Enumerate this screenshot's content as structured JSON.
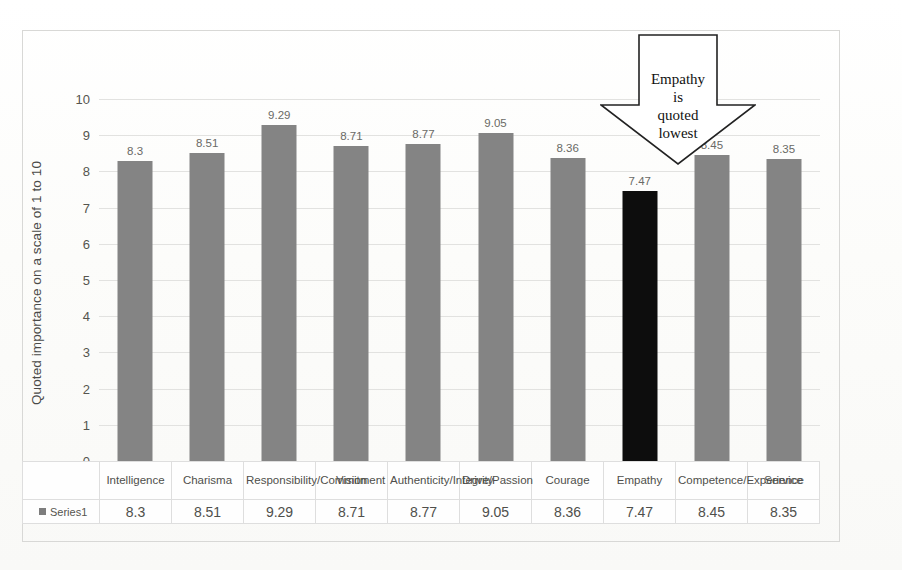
{
  "chart_data": {
    "type": "bar",
    "title": "",
    "xlabel": "",
    "ylabel": "Quoted importance on a scale of 1 to 10",
    "ylim": [
      0,
      10
    ],
    "ytick_step": 1,
    "grid": true,
    "legend_position": "table-stub-left",
    "categories": [
      "Intelligence",
      "Charisma",
      "Responsibility/Commitment",
      "Vision",
      "Authenticity/Integrity",
      "Drive/Passion",
      "Courage",
      "Empathy",
      "Competence/Experience",
      "Service"
    ],
    "series": [
      {
        "name": "Series1",
        "values": [
          8.3,
          8.51,
          9.29,
          8.71,
          8.77,
          9.05,
          8.36,
          7.47,
          8.45,
          8.35
        ]
      }
    ],
    "highlighted_category": "Empathy",
    "annotations": [
      {
        "shape": "down-arrow",
        "text": "Empathy is quoted lowest",
        "points_to": "Empathy"
      }
    ]
  },
  "axis": {
    "y_title": "Quoted importance on a scale of 1 to 10",
    "y_ticks": [
      "10",
      "9",
      "8",
      "7",
      "6",
      "5",
      "4",
      "3",
      "2",
      "1",
      "0"
    ]
  },
  "bars": [
    {
      "category": "Intelligence",
      "value": 8.3,
      "label": "8.3",
      "color": "#848484"
    },
    {
      "category": "Charisma",
      "value": 8.51,
      "label": "8.51",
      "color": "#848484"
    },
    {
      "category": "Responsibility/Commitment",
      "value": 9.29,
      "label": "9.29",
      "color": "#848484"
    },
    {
      "category": "Vision",
      "value": 8.71,
      "label": "8.71",
      "color": "#848484"
    },
    {
      "category": "Authenticity/Integrity",
      "value": 8.77,
      "label": "8.77",
      "color": "#848484"
    },
    {
      "category": "Drive/Passion",
      "value": 9.05,
      "label": "9.05",
      "color": "#848484"
    },
    {
      "category": "Courage",
      "value": 8.36,
      "label": "8.36",
      "color": "#848484"
    },
    {
      "category": "Empathy",
      "value": 7.47,
      "label": "7.47",
      "color": "#0d0d0d"
    },
    {
      "category": "Competence/Experience",
      "value": 8.45,
      "label": "8.45",
      "color": "#848484"
    },
    {
      "category": "Service",
      "value": 8.35,
      "label": "8.35",
      "color": "#848484"
    }
  ],
  "callout": {
    "line1": "Empathy",
    "line2": "is",
    "line3": "quoted",
    "line4": "lowest"
  },
  "table": {
    "legend_label": "Series1",
    "category_labels": [
      "Intelligence",
      "Charisma",
      "Responsibility/Commitment",
      "Vision",
      "Authenticity/Integrity",
      "Drive/Passion",
      "Courage",
      "Empathy",
      "Competence/Experience",
      "Service"
    ],
    "value_labels": [
      "8.3",
      "8.51",
      "9.29",
      "8.71",
      "8.77",
      "9.05",
      "8.36",
      "7.47",
      "8.45",
      "8.35"
    ]
  },
  "colors": {
    "bar": "#848484",
    "bar_highlight": "#0d0d0d",
    "gridline": "#e2e2e0",
    "frame": "#d8d8d6",
    "text": "#4f4f4b"
  }
}
